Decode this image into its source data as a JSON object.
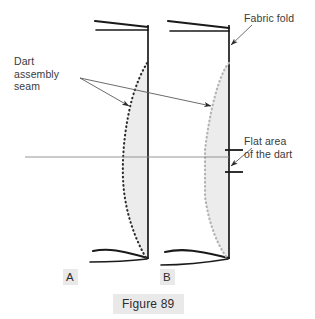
{
  "figure": {
    "caption": "Figure 89",
    "background_color": "#ffffff",
    "ink_color": "#1a1a1a",
    "text_color": "#3a3a3a",
    "label_background": "#e9e9e9",
    "dart_fill_color": "#ececec",
    "seam_color_a": "#2b2b2b",
    "seam_color_b": "#b4b4b4",
    "guide_line_color": "#8a8a8a"
  },
  "annotations": {
    "dart_assembly_seam": {
      "line1": "Dart",
      "line2": "assembly",
      "line3": "seam",
      "full_text": "Dart assembly seam",
      "position": "left",
      "leader_count": 2
    },
    "fabric_fold": {
      "line1": "Fabric fold",
      "full_text": "Fabric fold",
      "position": "top-right",
      "leader_count": 1
    },
    "flat_area": {
      "line1": "Flat area",
      "line2": "of the dart",
      "full_text": "Flat area of the dart",
      "position": "right",
      "leader_count": 1
    }
  },
  "panels": [
    {
      "letter": "A",
      "name": "panel-a",
      "fold_line_x": 148,
      "description": "pointed dart seam",
      "seam_style": "dotted-dark"
    },
    {
      "letter": "B",
      "name": "panel-b",
      "fold_line_x": 229,
      "description": "dart with flat area",
      "seam_style": "dotted-light"
    }
  ]
}
